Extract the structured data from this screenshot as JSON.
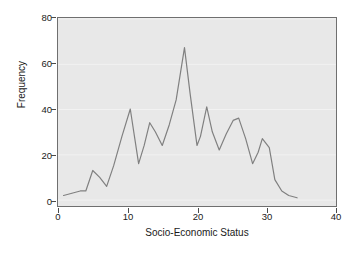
{
  "chart_data": {
    "type": "line",
    "title": "",
    "xlabel": "Socio-Economic Status",
    "ylabel": "Frequency",
    "xlim": [
      0,
      40
    ],
    "ylim": [
      0,
      80
    ],
    "xticks": [
      0,
      10,
      20,
      30,
      40
    ],
    "yticks": [
      0,
      20,
      40,
      60,
      80
    ],
    "grid": true,
    "grid_axis": "y",
    "legend": "none",
    "line_color": "#808080",
    "plot_background": "#e8e8e8",
    "series": [
      {
        "name": "Frequency",
        "x": [
          0.8,
          2.0,
          3.2,
          4.0,
          5.0,
          6.0,
          7.0,
          8.0,
          9.2,
          10.4,
          11.0,
          11.6,
          12.4,
          13.2,
          14.0,
          15.0,
          16.0,
          17.0,
          18.2,
          19.0,
          20.0,
          20.5,
          21.4,
          22.2,
          23.2,
          24.2,
          25.2,
          26.0,
          27.0,
          28.0,
          28.8,
          29.4,
          30.4,
          31.2,
          32.2,
          33.2,
          34.4
        ],
        "y": [
          2,
          3,
          4,
          4,
          13,
          10,
          6,
          15,
          28,
          40,
          28,
          16,
          24,
          34,
          30,
          24,
          33,
          44,
          67,
          47,
          24,
          28,
          41,
          30,
          22,
          29,
          35,
          36,
          27,
          16,
          21,
          27,
          23,
          9,
          4,
          2,
          1
        ]
      }
    ]
  },
  "axis": {
    "ytick_labels": [
      "0",
      "20",
      "40",
      "60",
      "80"
    ],
    "xtick_labels": [
      "0",
      "10",
      "20",
      "30",
      "40"
    ],
    "xlabel": "Socio-Economic Status",
    "ylabel": "Frequency"
  }
}
